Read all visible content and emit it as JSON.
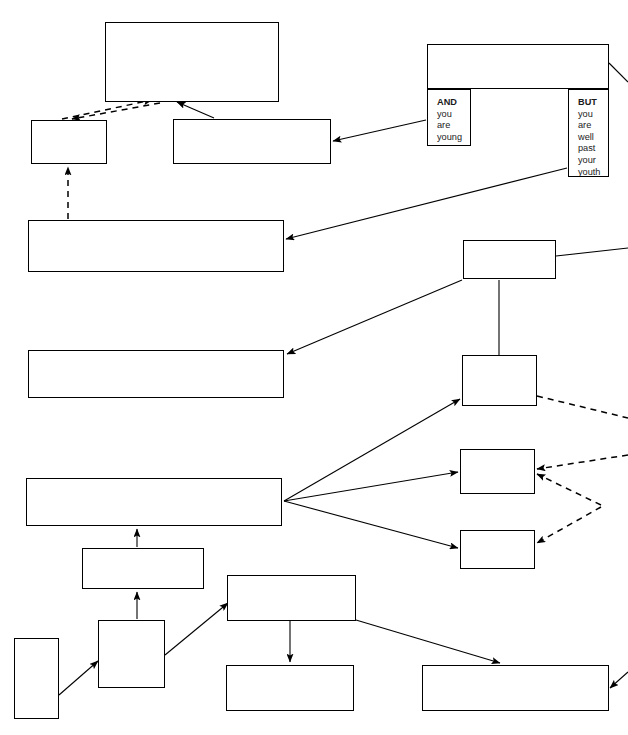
{
  "nodes": [
    {
      "id": "by-then",
      "text": "By then you will be so well\nestablished in tennis and so\nknowledgeable that you will not\nneed this chart anymore!",
      "style": "normal",
      "align": "tl",
      "x": 105,
      "y": 22,
      "w": 174,
      "h": 80
    },
    {
      "id": "you-get-better",
      "text": "You get better and better\npartners and opponents",
      "style": "normal",
      "align": "tc",
      "x": 427,
      "y": 44,
      "w": 182,
      "h": 45
    },
    {
      "id": "and-you-are-young",
      "text": "AND\nyou\nare\nyoung",
      "style": "mixed-and",
      "align": "tl",
      "x": 427,
      "y": 89,
      "w": 44,
      "h": 57
    },
    {
      "id": "but-you-are-well-past-your-youth",
      "text": "BUT\nyou\nare\nwell\npast\nyour\nyouth",
      "style": "mixed-but",
      "align": "tl",
      "x": 568,
      "y": 89,
      "w": 41,
      "h": 88
    },
    {
      "id": "but-keep-studying",
      "text": "But keep\nstudying\nthe game",
      "style": "italic",
      "align": "tl",
      "x": 31,
      "y": 120,
      "w": 76,
      "h": 44
    },
    {
      "id": "open-tournaments",
      "text": "You play open tournaments\nand/or gain a regular place in\nCounty team.",
      "style": "normal",
      "align": "tl",
      "x": 173,
      "y": 119,
      "w": 158,
      "h": 45
    },
    {
      "id": "continue-enjoying",
      "text": "You continue enjoying playing tennis, perhaps\ncompeting in open and veterans' tournaments and\nin club and county matches",
      "style": "normal",
      "align": "tl",
      "x": 28,
      "y": 220,
      "w": 256,
      "h": 52
    },
    {
      "id": "take-one-of-two-routes",
      "text": "You take one of\ntwo routes",
      "style": "normal",
      "align": "cl",
      "x": 463,
      "y": 240,
      "w": 93,
      "h": 39
    },
    {
      "id": "ambition-fulfilled",
      "text": "Your ambition is fulfilled at the level of steady\nsocial play, perhaps later helping own off-spring",
      "style": "normal",
      "align": "cl",
      "x": 28,
      "y": 350,
      "w": 256,
      "h": 48
    },
    {
      "id": "decide-to-join-club",
      "text": "You decide to\njoin a club",
      "style": "normal",
      "align": "cl",
      "x": 462,
      "y": 355,
      "w": 75,
      "h": 51
    },
    {
      "id": "at-a-club",
      "text": "At a club",
      "style": "normal",
      "align": "cc",
      "x": 460,
      "y": 449,
      "w": 75,
      "h": 45
    },
    {
      "id": "first-attempts",
      "text": "Your first attempts and practice games are likely\nto be on courts",
      "style": "normal",
      "align": "cl",
      "x": 26,
      "y": 478,
      "w": 256,
      "h": 48
    },
    {
      "id": "in-parks",
      "text": "In parks",
      "style": "normal",
      "align": "cc",
      "x": 460,
      "y": 530,
      "w": 75,
      "h": 39
    },
    {
      "id": "you-are-an-adult",
      "text": "YOU ARE AN ADULT",
      "style": "bold",
      "align": "cc",
      "x": 82,
      "y": 548,
      "w": 122,
      "h": 41
    },
    {
      "id": "you-are-under-18",
      "text": "YOU ARE UNDER 18",
      "style": "bold",
      "align": "cc",
      "x": 227,
      "y": 575,
      "w": 129,
      "h": 46
    },
    {
      "id": "you-wish-to-play-tennis",
      "text": "YOU\nWISH\nTO\nPLAY\nTENNIS",
      "style": "stack",
      "align": "cl",
      "x": 98,
      "y": 620,
      "w": 67,
      "h": 68
    },
    {
      "id": "start",
      "text": "S\nT\nA\nR\nT",
      "style": "stack",
      "align": "cc",
      "x": 14,
      "y": 638,
      "w": 45,
      "h": 81
    },
    {
      "id": "check-notices",
      "text": "Check notices and/or\nask school  PE staff",
      "style": "normal",
      "align": "cl",
      "x": 226,
      "y": 665,
      "w": 128,
      "h": 46
    },
    {
      "id": "initial-experience",
      "text": "Initial experience likely on school\ncourts, or parks",
      "style": "normal",
      "align": "cl",
      "x": 422,
      "y": 665,
      "w": 187,
      "h": 46
    }
  ],
  "edges": [
    {
      "id": "keep-studying-to-by-then",
      "from": "but-keep-studying",
      "to": "by-then",
      "kind": "dashed",
      "points": "62,119 152,100"
    },
    {
      "id": "by-then-to-keep-studying",
      "from": "by-then",
      "to": "but-keep-studying",
      "kind": "dashed",
      "points": "160,103 72,119"
    },
    {
      "id": "tournaments-to-by-then",
      "from": "open-tournaments",
      "to": "by-then",
      "kind": "solid",
      "points": "214,118 177,102"
    },
    {
      "id": "and-young-to-tournaments",
      "from": "and-you-are-young",
      "to": "open-tournaments",
      "kind": "solid",
      "points": "426,120 333,141"
    },
    {
      "id": "but-past-youth-to-continue",
      "from": "but-you-are-well-past-your-youth",
      "to": "continue-enjoying",
      "kind": "solid",
      "points": "567,168 286,239"
    },
    {
      "id": "continue-to-keep-studying",
      "from": "continue-enjoying",
      "to": "but-keep-studying",
      "kind": "dashed",
      "points": "68,219 68,167"
    },
    {
      "id": "two-routes-to-ambition",
      "from": "take-one-of-two-routes",
      "to": "ambition-fulfilled",
      "kind": "solid",
      "points": "462,280 287,354"
    },
    {
      "id": "two-routes-to-join-club",
      "from": "take-one-of-two-routes",
      "to": "decide-to-join-club",
      "kind": "solid-noarrow",
      "points": "499,280 499,355"
    },
    {
      "id": "two-routes-right-stub",
      "from": "take-one-of-two-routes",
      "to": "offpage-right",
      "kind": "solid-noarrow",
      "points": "556,256 628,248"
    },
    {
      "id": "get-better-right-stub",
      "from": "you-get-better",
      "to": "offpage-right",
      "kind": "solid-noarrow",
      "points": "609,63 628,82"
    },
    {
      "id": "first-attempts-to-join-club",
      "from": "first-attempts",
      "to": "decide-to-join-club",
      "kind": "solid",
      "points": "284,501 460,399"
    },
    {
      "id": "first-attempts-to-at-a-club",
      "from": "first-attempts",
      "to": "at-a-club",
      "kind": "solid",
      "points": "284,501 458,472"
    },
    {
      "id": "first-attempts-to-in-parks",
      "from": "first-attempts",
      "to": "in-parks",
      "kind": "solid",
      "points": "284,501 458,548"
    },
    {
      "id": "join-club-dashed-out",
      "from": "decide-to-join-club",
      "to": "offpage-right",
      "kind": "dashed-noarrow",
      "points": "537,396 628,418"
    },
    {
      "id": "offpage-to-at-a-club-upper",
      "from": "offpage-right",
      "to": "at-a-club",
      "kind": "dashed",
      "points": "628,455 537,469"
    },
    {
      "id": "offpage-to-at-a-club-lower",
      "from": "offpage-right",
      "to": "at-a-club",
      "kind": "dashed",
      "points": "601,505 537,474"
    },
    {
      "id": "offpage-to-in-parks",
      "from": "offpage-right",
      "to": "in-parks",
      "kind": "dashed",
      "points": "601,507 537,543"
    },
    {
      "id": "adult-to-first-attempts",
      "from": "you-are-an-adult",
      "to": "first-attempts",
      "kind": "solid",
      "points": "137,547 137,529"
    },
    {
      "id": "wish-to-play-to-adult",
      "from": "you-wish-to-play-tennis",
      "to": "you-are-an-adult",
      "kind": "solid",
      "points": "137,619 137,592"
    },
    {
      "id": "start-to-wish-to-play",
      "from": "start",
      "to": "you-wish-to-play-tennis",
      "kind": "solid",
      "points": "59,695 98,661"
    },
    {
      "id": "wish-to-play-to-under-18",
      "from": "you-wish-to-play-tennis",
      "to": "you-are-under-18",
      "kind": "solid",
      "points": "165,655 228,603"
    },
    {
      "id": "under-18-to-check-notices",
      "from": "you-are-under-18",
      "to": "check-notices",
      "kind": "solid",
      "points": "290,621 290,662"
    },
    {
      "id": "under-18-to-initial-experience",
      "from": "you-are-under-18",
      "to": "initial-experience",
      "kind": "solid",
      "points": "356,620 500,663"
    },
    {
      "id": "initial-experience-out",
      "from": "initial-experience",
      "to": "offpage-right",
      "kind": "solid-arrowin",
      "points": "628,672 610,688"
    }
  ],
  "colors": {
    "stroke": "#000000",
    "fill": "#ffffff",
    "text": "#1a1a1a"
  }
}
